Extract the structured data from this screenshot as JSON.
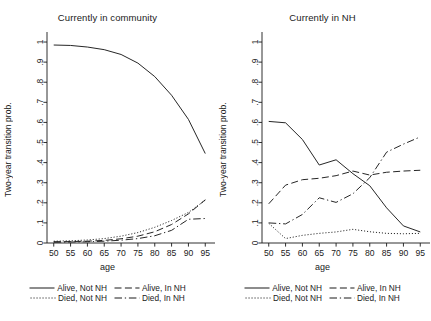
{
  "chart_data": {
    "type": "line",
    "title": "",
    "xlabel": "age",
    "ylabel": "Two-year transition prob.",
    "xlim": [
      48,
      97
    ],
    "ylim": [
      0,
      1.02
    ],
    "xticks": [
      50,
      55,
      60,
      65,
      70,
      75,
      80,
      85,
      90,
      95
    ],
    "xticklabels": [
      "50",
      "55",
      "60",
      "65",
      "70",
      "75",
      "80",
      "85",
      "90",
      "95"
    ],
    "yticks": [
      0,
      0.1,
      0.2,
      0.3,
      0.4,
      0.5,
      0.6,
      0.7,
      0.8,
      0.9,
      1
    ],
    "yticklabels": [
      "0",
      ".1",
      ".2",
      ".3",
      ".4",
      ".5",
      ".6",
      ".7",
      ".8",
      ".9",
      "1"
    ],
    "grid": false,
    "legend_position": "below-panel",
    "panels": [
      {
        "id": "community",
        "title": "Currently in community",
        "x": [
          50,
          55,
          60,
          65,
          70,
          75,
          80,
          85,
          90,
          95
        ],
        "series": [
          {
            "name": "Alive, Not NH",
            "style": "solid",
            "values": [
              0.985,
              0.983,
              0.975,
              0.962,
              0.938,
              0.895,
              0.828,
              0.735,
              0.615,
              0.445
            ]
          },
          {
            "name": "Alive, In NH",
            "style": "dashed",
            "values": [
              0.006,
              0.007,
              0.009,
              0.013,
              0.021,
              0.034,
              0.056,
              0.092,
              0.145,
              0.215
            ]
          },
          {
            "name": "Died, Not NH",
            "style": "dotted",
            "values": [
              0.009,
              0.011,
              0.015,
              0.022,
              0.034,
              0.052,
              0.078,
              0.112,
              0.152,
              0.213
            ]
          },
          {
            "name": "Died, In NH",
            "style": "dashdot",
            "values": [
              0.004,
              0.005,
              0.006,
              0.009,
              0.014,
              0.022,
              0.036,
              0.063,
              0.118,
              0.122
            ]
          }
        ]
      },
      {
        "id": "nursing-home",
        "title": "Currently in NH",
        "x": [
          50,
          55,
          60,
          65,
          70,
          75,
          80,
          85,
          90,
          95
        ],
        "series": [
          {
            "name": "Alive, Not NH",
            "style": "solid",
            "values": [
              0.605,
              0.598,
              0.515,
              0.388,
              0.414,
              0.345,
              0.285,
              0.175,
              0.085,
              0.055
            ]
          },
          {
            "name": "Alive, In NH",
            "style": "dashed",
            "values": [
              0.195,
              0.288,
              0.315,
              0.322,
              0.335,
              0.358,
              0.338,
              0.352,
              0.358,
              0.362
            ]
          },
          {
            "name": "Died, Not NH",
            "style": "dotted",
            "values": [
              0.098,
              0.022,
              0.038,
              0.048,
              0.055,
              0.068,
              0.056,
              0.048,
              0.046,
              0.048
            ]
          },
          {
            "name": "Died, In NH",
            "style": "dashdot",
            "values": [
              0.1,
              0.095,
              0.142,
              0.225,
              0.202,
              0.245,
              0.325,
              0.452,
              0.492,
              0.528
            ]
          }
        ]
      }
    ],
    "legend": [
      {
        "label": "Alive, Not NH",
        "style": "solid"
      },
      {
        "label": "Alive, In NH",
        "style": "dashed"
      },
      {
        "label": "Died, Not NH",
        "style": "dotted"
      },
      {
        "label": "Died, In NH",
        "style": "dashdot"
      }
    ],
    "colors": {
      "line": "#1a1a1a",
      "axis": "#1a1a1a",
      "background": "#ffffff"
    }
  }
}
